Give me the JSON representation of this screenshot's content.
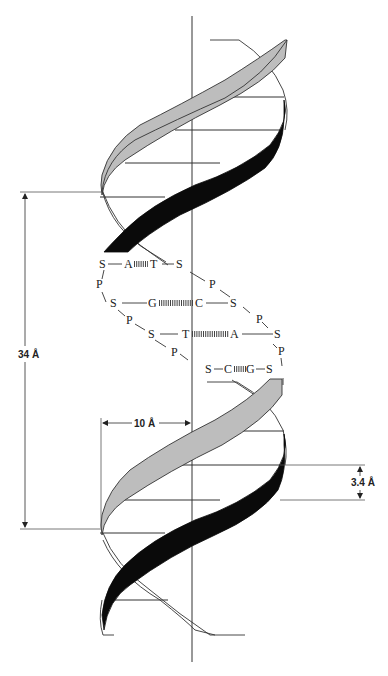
{
  "diagram": {
    "colors": {
      "strand_light": "#bdbdbd",
      "strand_dark": "#0a0a0a",
      "line": "#333333",
      "background": "#ffffff"
    },
    "dimensions": {
      "pitch": {
        "label": "34 Å",
        "value": 34,
        "unit": "Å"
      },
      "radius": {
        "label": "10 Å",
        "value": 10,
        "unit": "Å"
      },
      "rise": {
        "label": "3.4 Å",
        "value": 3.4,
        "unit": "Å"
      }
    },
    "base_pairs": [
      {
        "left_sugar": "S",
        "left_base": "A",
        "right_base": "T",
        "right_sugar": "S"
      },
      {
        "left_sugar": "S",
        "left_base": "G",
        "right_base": "C",
        "right_sugar": "S"
      },
      {
        "left_sugar": "S",
        "left_base": "T",
        "right_base": "A",
        "right_sugar": "S"
      },
      {
        "left_sugar": "S",
        "left_base": "C",
        "right_base": "G",
        "right_sugar": "S"
      }
    ],
    "phosphates": [
      "P",
      "P",
      "P",
      "P",
      "P",
      "P",
      "P"
    ]
  }
}
